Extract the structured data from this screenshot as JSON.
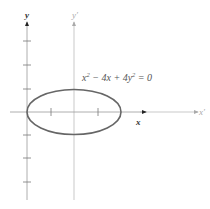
{
  "diagram": {
    "equation": "x² − 4x + 4y² = 0",
    "equation_parts": {
      "a": "x",
      "b": " − 4x + 4y",
      "c": " = 0",
      "sup": "2"
    },
    "axes": {
      "x_label": "x",
      "y_label": "y",
      "x_prime_label": "x′",
      "y_prime_label": "y′"
    },
    "ellipse": {
      "center": [
        2,
        0
      ],
      "semi_major": 2,
      "semi_minor": 1
    },
    "colors": {
      "curve": "#666666",
      "axis_primary": "#555555",
      "axis_translated": "#bbbbbb",
      "text": "#555555"
    }
  }
}
